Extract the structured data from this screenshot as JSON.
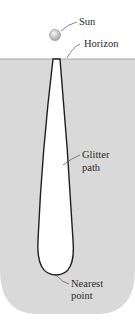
{
  "labels": {
    "sun": "Sun",
    "horizon": "Horizon",
    "glitter_line1": "Glitter",
    "glitter_line2": "path",
    "nearest_line1": "Nearest",
    "nearest_line2": "point"
  },
  "colors": {
    "background": "#ffffff",
    "sea": "#d9d9d9",
    "path_fill": "#ffffff",
    "path_stroke": "#1e1e1e",
    "sun": "#cfcfcf",
    "leader": "#555555"
  }
}
